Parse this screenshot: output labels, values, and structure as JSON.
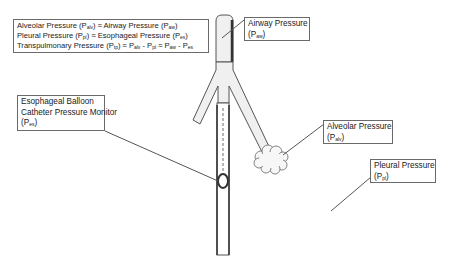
{
  "summary_box": {
    "lines": [
      {
        "pre": "Alveolar Pressure (P",
        "sub1": "alv",
        "mid": ") ≈ Airway Pressure (P",
        "sub2": "aw",
        "post": ")"
      },
      {
        "pre": "Pleural Pressure (P",
        "sub1": "pl",
        "mid": ") ≈ Esophageal Pressure (P",
        "sub2": "es",
        "post": ")"
      }
    ],
    "tp_line": {
      "t1": "Transpulmonary Pressure (P",
      "s1": "tp",
      "t2": ") ≈ P",
      "s2": "alv",
      "t3": " - P",
      "s3": "pl",
      "t4": " ≈ P",
      "s4": "aw",
      "t5": " - P",
      "s5": "es"
    }
  },
  "labels": {
    "airway": {
      "title": "Airway Pressure",
      "sym": "(P",
      "sub": "aw",
      "close": ")"
    },
    "esophageal": {
      "line1": "Esophageal Balloon",
      "line2": "Catheter Pressure Monitor",
      "sym": "(P",
      "sub": "es",
      "close": ")"
    },
    "alveolar": {
      "title": "Alveolar Pressure",
      "sym": "(P",
      "sub": "alv",
      "close": ")"
    },
    "pleural": {
      "title": "Pleural Pressure",
      "sym": "(P",
      "sub": "pl",
      "close": ")"
    }
  },
  "colors": {
    "outline": "#555555",
    "tube_fill": "#f0f0f0",
    "dark_edge": "#333333",
    "catheter_dash": "#b5b5b5"
  }
}
